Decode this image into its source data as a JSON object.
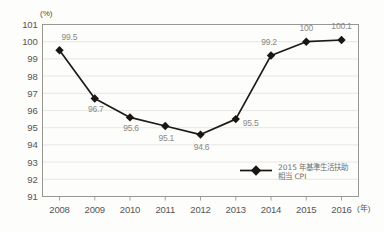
{
  "chart_data": {
    "type": "line",
    "title": "",
    "subtitle": "",
    "xlabel": "(年)",
    "ylabel": "(%)",
    "categories": [
      "2008",
      "2009",
      "2010",
      "2011",
      "2012",
      "2013",
      "2014",
      "2015",
      "2016"
    ],
    "values": [
      99.5,
      96.7,
      95.6,
      95.1,
      94.6,
      95.5,
      99.2,
      100,
      100.1
    ],
    "point_labels": [
      "99.5",
      "96.7",
      "95.6",
      "95.1",
      "94.6",
      "95.5",
      "99.2",
      "100",
      "100.1"
    ],
    "series": [
      {
        "name": "2015年基準生活扶助相当CPI",
        "values": [
          99.5,
          96.7,
          95.6,
          95.1,
          94.6,
          95.5,
          99.2,
          100,
          100.1
        ],
        "color": "#1a1613",
        "marker": "diamond"
      }
    ],
    "ylim": [
      91,
      101
    ],
    "ytick_labels": [
      "101",
      "100",
      "99",
      "98",
      "97",
      "96",
      "95",
      "94",
      "93",
      "92",
      "91"
    ],
    "ytick_values": [
      101,
      100,
      99,
      98,
      97,
      96,
      95,
      94,
      93,
      92,
      91
    ],
    "grid": true,
    "grid_color": "#ddddd8",
    "legend_position": "inside-bottom-right",
    "line_color": "#1a1613",
    "label_color": "#8a8a86",
    "axis_color": "#8e8e88",
    "background": "#fdfdfb"
  },
  "legend": {
    "entries": [
      {
        "label_line1": "2015 年基準生活扶助",
        "label_line2": "相当 CPI"
      }
    ]
  },
  "axes": {
    "y_unit": "(%)",
    "x_unit": "(年)"
  }
}
